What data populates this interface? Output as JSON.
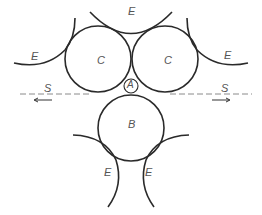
{
  "diagram": {
    "labels": {
      "e_top": "E",
      "e_left": "E",
      "e_right": "E",
      "e_bottom_left": "E",
      "e_bottom_right": "E",
      "c_left": "C",
      "c_right": "C",
      "a": "A",
      "b": "B",
      "s_left": "S",
      "s_right": "S"
    },
    "colors": {
      "line": "#2a2a2a",
      "dash": "#8a8a8a",
      "label": "#555555",
      "background": "#ffffff"
    }
  }
}
